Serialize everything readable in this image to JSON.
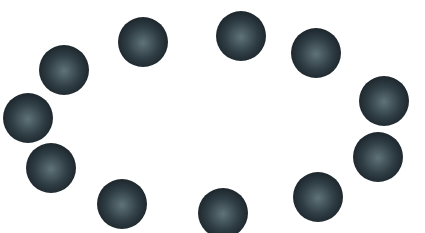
{
  "scene": {
    "background": "#ffffff",
    "sphere_colors": {
      "highlight": "#5f7478",
      "mid": "#2f3d44",
      "edge": "#0f161b"
    },
    "spheres": [
      {
        "cx": 64,
        "cy": 70,
        "r": 25
      },
      {
        "cx": 143,
        "cy": 42,
        "r": 25
      },
      {
        "cx": 241,
        "cy": 36,
        "r": 25
      },
      {
        "cx": 316,
        "cy": 53,
        "r": 25
      },
      {
        "cx": 384,
        "cy": 101,
        "r": 25
      },
      {
        "cx": 378,
        "cy": 157,
        "r": 25
      },
      {
        "cx": 318,
        "cy": 197,
        "r": 25
      },
      {
        "cx": 223,
        "cy": 213,
        "r": 25
      },
      {
        "cx": 122,
        "cy": 204,
        "r": 25
      },
      {
        "cx": 51,
        "cy": 168,
        "r": 25
      },
      {
        "cx": 28,
        "cy": 118,
        "r": 25
      }
    ]
  }
}
